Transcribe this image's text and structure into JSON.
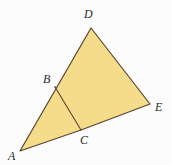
{
  "figure": {
    "kind": "geometry-diagram",
    "width": 172,
    "height": 165,
    "background_color": "#fcfcfc",
    "fill_color": "#f5dc8a",
    "stroke_color": "#5a4530",
    "stroke_width": 1.2,
    "label_color": "#2b2b2b",
    "points": {
      "A": {
        "label": "A",
        "x": 20,
        "y": 151,
        "label_x": 8,
        "label_y": 150
      },
      "B": {
        "label": "B",
        "x": 55,
        "y": 87,
        "label_x": 43,
        "label_y": 73
      },
      "C": {
        "label": "C",
        "x": 81,
        "y": 130,
        "label_x": 80,
        "label_y": 134
      },
      "D": {
        "label": "D",
        "x": 91,
        "y": 28,
        "label_x": 84,
        "label_y": 8
      },
      "E": {
        "label": "E",
        "x": 150,
        "y": 104,
        "label_x": 155,
        "label_y": 101
      }
    },
    "shapes": [
      {
        "name": "quadrilateral-ADEC",
        "vertices": "A,D,E,C",
        "filled": true,
        "path": "20,151 91,28 150,104 81,130"
      }
    ],
    "segments": [
      {
        "name": "segment-AD",
        "from": "A",
        "to": "D"
      },
      {
        "name": "segment-DE",
        "from": "D",
        "to": "E"
      },
      {
        "name": "segment-EC",
        "from": "E",
        "to": "C"
      },
      {
        "name": "segment-CA",
        "from": "C",
        "to": "A"
      },
      {
        "name": "segment-BC",
        "from": "B",
        "to": "C"
      }
    ]
  }
}
